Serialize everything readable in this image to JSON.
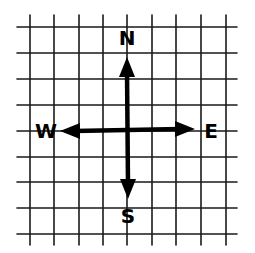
{
  "diagram": {
    "type": "compass-rose-on-grid",
    "colors": {
      "background": "#ffffff",
      "ink": "#000000",
      "grid": "#1a1a1a"
    },
    "grid": {
      "vertical_lines_x": [
        30,
        54,
        79,
        103,
        127,
        152,
        176,
        201,
        226
      ],
      "horizontal_lines_y": [
        27,
        53,
        79,
        105,
        131,
        157,
        182,
        208,
        234
      ],
      "x_extent": [
        17,
        237
      ],
      "y_extent": [
        15,
        245
      ]
    },
    "center": {
      "x": 127,
      "y": 130
    },
    "directions": {
      "north": {
        "label": "N",
        "x": 127,
        "y": 38
      },
      "south": {
        "label": "S",
        "x": 128,
        "y": 216
      },
      "west": {
        "label": "W",
        "x": 46,
        "y": 131
      },
      "east": {
        "label": "E",
        "x": 211,
        "y": 131
      }
    },
    "arrows": {
      "north_tip": {
        "x": 127,
        "y": 57
      },
      "south_tip": {
        "x": 128,
        "y": 199
      },
      "west_tip": {
        "x": 60,
        "y": 131
      },
      "east_tip": {
        "x": 195,
        "y": 129
      }
    }
  }
}
